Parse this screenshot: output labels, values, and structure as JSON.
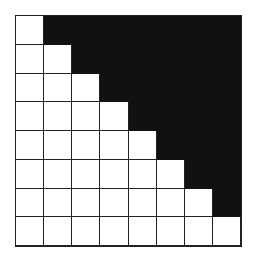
{
  "diagram": {
    "type": "grid",
    "rows": 8,
    "cols": 8,
    "colors": {
      "filled": "#111111",
      "empty": "#ffffff",
      "line": "#222222"
    },
    "cells": [
      [
        0,
        1,
        1,
        1,
        1,
        1,
        1,
        1
      ],
      [
        0,
        0,
        1,
        1,
        1,
        1,
        1,
        1
      ],
      [
        0,
        0,
        0,
        1,
        1,
        1,
        1,
        1
      ],
      [
        0,
        0,
        0,
        0,
        1,
        1,
        1,
        1
      ],
      [
        0,
        0,
        0,
        0,
        0,
        1,
        1,
        1
      ],
      [
        0,
        0,
        0,
        0,
        0,
        0,
        1,
        1
      ],
      [
        0,
        0,
        0,
        0,
        0,
        0,
        0,
        1
      ],
      [
        0,
        0,
        0,
        0,
        0,
        0,
        0,
        0
      ]
    ]
  }
}
